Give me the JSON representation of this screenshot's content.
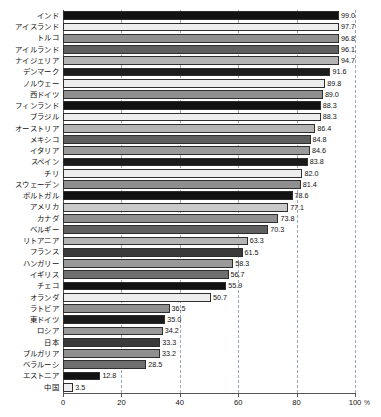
{
  "chart_data": {
    "type": "bar",
    "orientation": "horizontal",
    "title": "",
    "xlabel": "%",
    "ylabel": "",
    "xlim": [
      0,
      100
    ],
    "grid": true,
    "grid_style": "dashed vertical",
    "legend": "none",
    "xticks": [
      0,
      20,
      40,
      60,
      80,
      100
    ],
    "xtick_labels": [
      "0",
      "20",
      "40",
      "60",
      "80",
      "100"
    ],
    "unit_label": "%",
    "categories": [
      "インド",
      "アイスランド",
      "トルコ",
      "アイルランド",
      "ナイジェリア",
      "デンマーク",
      "ノルウェー",
      "西ドイツ",
      "フィンランド",
      "ブラジル",
      "オーストリア",
      "メキシコ",
      "イタリア",
      "スペイン",
      "チリ",
      "スウェーデン",
      "ポルトガル",
      "アメリカ",
      "カナダ",
      "ベルギー",
      "リトアニア",
      "フランス",
      "ハンガリー",
      "イギリス",
      "チェコ",
      "オランダ",
      "ラトビア",
      "東ドイツ",
      "ロシア",
      "日本",
      "ブルガリア",
      "ベラルーシ",
      "エストニア",
      "中国"
    ],
    "values": [
      99.0,
      97.7,
      96.8,
      96.1,
      94.7,
      91.6,
      89.8,
      89.0,
      88.3,
      88.3,
      86.4,
      84.8,
      84.6,
      83.8,
      82.0,
      81.4,
      78.6,
      77.1,
      73.8,
      70.3,
      63.3,
      61.5,
      58.3,
      56.7,
      55.9,
      50.7,
      36.5,
      35.0,
      34.2,
      33.3,
      33.2,
      28.5,
      12.8,
      3.5
    ],
    "value_labels": [
      "99.0",
      "97.7",
      "96.8",
      "96.1",
      "94.7",
      "91.6",
      "89.8",
      "89.0",
      "88.3",
      "88.3",
      "86.4",
      "84.8",
      "84.6",
      "83.8",
      "82.0",
      "81.4",
      "78.6",
      "77.1",
      "73.8",
      "70.3",
      "63.3",
      "61.5",
      "58.3",
      "56.7",
      "55.9",
      "50.7",
      "36.5",
      "35.0",
      "34.2",
      "33.3",
      "33.2",
      "28.5",
      "12.8",
      "3.5"
    ],
    "bar_colors": [
      "#121212",
      "#ededed",
      "#8f8f8f",
      "#5f5f5f",
      "#b4b4b4",
      "#1b1b1b",
      "#ededed",
      "#8f8f8f",
      "#121212",
      "#ededed",
      "#b4b4b4",
      "#5f5f5f",
      "#9a9a9a",
      "#1b1b1b",
      "#ededed",
      "#8f8f8f",
      "#121212",
      "#c9c9c9",
      "#8f8f8f",
      "#5f5f5f",
      "#b4b4b4",
      "#3a3a3a",
      "#9a9a9a",
      "#6e6e6e",
      "#121212",
      "#ededed",
      "#8f8f8f",
      "#1b1b1b",
      "#9a9a9a",
      "#3a3a3a",
      "#8f8f8f",
      "#6e6e6e",
      "#121212",
      "#ededed"
    ]
  }
}
